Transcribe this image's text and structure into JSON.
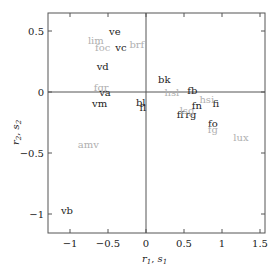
{
  "chart_data": {
    "type": "scatter",
    "title": "",
    "xlabel": "r1, s1",
    "ylabel": "r2, s2",
    "xlim": [
      -1.25,
      1.55
    ],
    "ylim": [
      -1.16,
      0.66
    ],
    "xticks": [
      -1,
      -0.5,
      0,
      0.5,
      1,
      1.5
    ],
    "xtick_labels": [
      "−1",
      "−0.5",
      "0",
      "0.5",
      "1",
      "1.5"
    ],
    "yticks": [
      -1,
      -0.5,
      0,
      0.5
    ],
    "ytick_labels": [
      "−1",
      "−0.5",
      "0",
      "0.5"
    ],
    "grid": false,
    "zero_lines": true,
    "series": [
      {
        "name": "r (dark labels)",
        "color": "#222222",
        "points": [
          {
            "label": "ve",
            "x": -0.41,
            "y": 0.5
          },
          {
            "label": "vc",
            "x": -0.33,
            "y": 0.37
          },
          {
            "label": "vd",
            "x": -0.57,
            "y": 0.21
          },
          {
            "label": "va",
            "x": -0.54,
            "y": 0.0
          },
          {
            "label": "vm",
            "x": -0.61,
            "y": -0.09
          },
          {
            "label": "bl",
            "x": -0.07,
            "y": -0.08
          },
          {
            "label": "fl",
            "x": -0.04,
            "y": -0.12
          },
          {
            "label": "bk",
            "x": 0.24,
            "y": 0.11
          },
          {
            "label": "fb",
            "x": 0.61,
            "y": 0.02
          },
          {
            "label": "fi",
            "x": 0.92,
            "y": -0.09
          },
          {
            "label": "fn",
            "x": 0.67,
            "y": -0.11
          },
          {
            "label": "ff",
            "x": 0.45,
            "y": -0.18
          },
          {
            "label": "rg",
            "x": 0.59,
            "y": -0.18
          },
          {
            "label": "fo",
            "x": 0.88,
            "y": -0.25
          },
          {
            "label": "vb",
            "x": -1.04,
            "y": -0.97
          }
        ]
      },
      {
        "name": "s (gray labels)",
        "color": "#b0b0b0",
        "points": [
          {
            "label": "lim",
            "x": -0.66,
            "y": 0.43
          },
          {
            "label": "foc",
            "x": -0.57,
            "y": 0.37
          },
          {
            "label": "brf",
            "x": -0.12,
            "y": 0.39
          },
          {
            "label": "fgr",
            "x": -0.59,
            "y": 0.04
          },
          {
            "label": "hsl",
            "x": 0.34,
            "y": 0.0
          },
          {
            "label": "hsi",
            "x": 0.8,
            "y": -0.06
          },
          {
            "label": "lsg",
            "x": 0.54,
            "y": -0.15
          },
          {
            "label": "fg",
            "x": 0.88,
            "y": -0.3
          },
          {
            "label": "lux",
            "x": 1.25,
            "y": -0.37
          },
          {
            "label": "amv",
            "x": -0.76,
            "y": -0.43
          }
        ]
      }
    ]
  },
  "axes": {
    "x_label_main": "r",
    "x_label_sub1": "1",
    "x_label_sep": ", ",
    "x_label_main2": "s",
    "x_label_sub2": "1",
    "y_label_main": "r",
    "y_label_sub1": "2",
    "y_label_sep": ", ",
    "y_label_main2": "s",
    "y_label_sub2": "2"
  }
}
